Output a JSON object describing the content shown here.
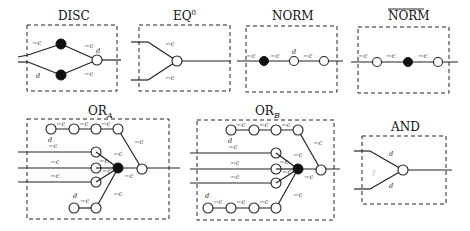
{
  "gadgets": {
    "disc": {
      "title": "DISC",
      "labels": {
        "top_in": "−c",
        "top_out": "−c",
        "bottom_in": "d",
        "bottom_out": "−c",
        "out": "d"
      }
    },
    "eq0": {
      "title": "EQ",
      "title_sup": "0",
      "labels": {
        "top": "−c",
        "bottom": "−c"
      }
    },
    "norm": {
      "title": "NORM",
      "labels": {
        "e1": "−c",
        "e2": "−c",
        "e3": "d",
        "e4": "−c"
      }
    },
    "norm_bar": {
      "title": "NORM",
      "overline": true,
      "labels": {
        "e1": "−c",
        "e2": "−c",
        "e3": "−c"
      }
    },
    "or_a": {
      "title": "OR",
      "title_sub": "A",
      "labels": {
        "chain1": "−c",
        "chain2": "−c",
        "chain3": "−c",
        "to_out": "−c",
        "in1_d": "d",
        "in1": "−c",
        "in2": "−c",
        "in3": "−c",
        "f1": "−c",
        "f2": "−c",
        "f3": "−c",
        "f_out": "−c",
        "bottom": "−c",
        "chain_bottom_d": "d",
        "chain_bottom": "−c"
      }
    },
    "or_b": {
      "title": "OR",
      "title_sub": "B",
      "labels": {
        "chain1": "−c",
        "chain2": "−c",
        "chain3": "−c",
        "to_out": "−c",
        "in1_d": "d",
        "in1": "−c",
        "in2": "−c",
        "in3": "−c",
        "f1": "−c",
        "f2": "−c",
        "f3": "−c",
        "f_out": "−c",
        "bottom": "−c",
        "chain_bottom_d": "d",
        "chain_bottom1": "−c",
        "chain_bottom2": "−c",
        "chain_bottom3": "−c"
      }
    },
    "and": {
      "title": "AND",
      "labels": {
        "top": "d",
        "bottom": "d",
        "dots": "⋮"
      }
    }
  },
  "legend": {
    "filled_node": "black vertex",
    "open_node": "white vertex"
  }
}
